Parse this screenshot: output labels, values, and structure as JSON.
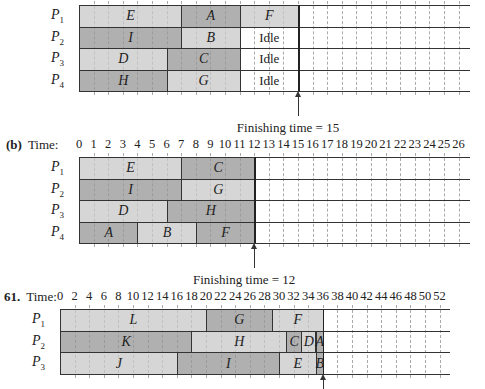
{
  "diagrams": [
    {
      "id": "a",
      "label_prefix": "",
      "time_label": "",
      "show_axis": false,
      "origin_x": 79,
      "px_per_unit": 14.6,
      "top": 5,
      "row_height": 21.5,
      "grid_end_x": 470,
      "units": 26,
      "grid_step": 1,
      "tick_labels": [],
      "processors": [
        "P1",
        "P2",
        "P3",
        "P4"
      ],
      "rows": [
        [
          {
            "task": "E",
            "start": 0,
            "end": 7,
            "shade": "light"
          },
          {
            "task": "A",
            "start": 7,
            "end": 11,
            "shade": "dark"
          },
          {
            "task": "F",
            "start": 11,
            "end": 15,
            "shade": "light"
          }
        ],
        [
          {
            "task": "I",
            "start": 0,
            "end": 7,
            "shade": "dark"
          },
          {
            "task": "B",
            "start": 7,
            "end": 11,
            "shade": "light"
          },
          {
            "task": "Idle",
            "start": 11,
            "end": 15,
            "shade": "idle"
          }
        ],
        [
          {
            "task": "D",
            "start": 0,
            "end": 6,
            "shade": "light"
          },
          {
            "task": "C",
            "start": 6,
            "end": 11,
            "shade": "dark"
          },
          {
            "task": "Idle",
            "start": 11,
            "end": 15,
            "shade": "idle"
          }
        ],
        [
          {
            "task": "H",
            "start": 0,
            "end": 6,
            "shade": "dark"
          },
          {
            "task": "G",
            "start": 6,
            "end": 11,
            "shade": "light"
          },
          {
            "task": "Idle",
            "start": 11,
            "end": 15,
            "shade": "idle"
          }
        ]
      ],
      "finishing_time": 15,
      "finishing_text": "Finishing time = 15"
    },
    {
      "id": "b",
      "label_prefix": "(b)",
      "time_label": "Time:",
      "show_axis": true,
      "origin_x": 79,
      "px_per_unit": 14.6,
      "top": 157,
      "row_height": 21.5,
      "grid_end_x": 470,
      "units": 26,
      "grid_step": 1,
      "tick_labels": [
        "0",
        "1",
        "2",
        "3",
        "4",
        "5",
        "6",
        "7",
        "8",
        "9",
        "10",
        "11",
        "12",
        "13",
        "14",
        "15",
        "16",
        "17",
        "18",
        "19",
        "20",
        "21",
        "22",
        "23",
        "24",
        "25",
        "26"
      ],
      "processors": [
        "P1",
        "P2",
        "P3",
        "P4"
      ],
      "rows": [
        [
          {
            "task": "E",
            "start": 0,
            "end": 7,
            "shade": "light"
          },
          {
            "task": "C",
            "start": 7,
            "end": 12,
            "shade": "dark"
          }
        ],
        [
          {
            "task": "I",
            "start": 0,
            "end": 7,
            "shade": "dark"
          },
          {
            "task": "G",
            "start": 7,
            "end": 12,
            "shade": "light"
          }
        ],
        [
          {
            "task": "D",
            "start": 0,
            "end": 6,
            "shade": "light"
          },
          {
            "task": "H",
            "start": 6,
            "end": 12,
            "shade": "dark"
          }
        ],
        [
          {
            "task": "A",
            "start": 0,
            "end": 4,
            "shade": "dark"
          },
          {
            "task": "B",
            "start": 4,
            "end": 8,
            "shade": "light"
          },
          {
            "task": "F",
            "start": 8,
            "end": 12,
            "shade": "dark"
          }
        ]
      ],
      "finishing_time": 12,
      "finishing_text": "Finishing time = 12"
    },
    {
      "id": "61",
      "label_prefix": "61.",
      "time_label": "Time:",
      "show_axis": true,
      "origin_x": 60,
      "px_per_unit": 7.3,
      "top": 309,
      "row_height": 21.7,
      "grid_end_x": 450,
      "units": 52,
      "grid_step": 2,
      "tick_labels": [
        "0",
        "2",
        "4",
        "6",
        "8",
        "10",
        "12",
        "14",
        "16",
        "18",
        "20",
        "22",
        "24",
        "26",
        "28",
        "30",
        "32",
        "34",
        "36",
        "38",
        "40",
        "42",
        "44",
        "46",
        "48",
        "50",
        "52"
      ],
      "processors": [
        "P1",
        "P2",
        "P3"
      ],
      "rows": [
        [
          {
            "task": "L",
            "start": 0,
            "end": 20,
            "shade": "light"
          },
          {
            "task": "G",
            "start": 20,
            "end": 29,
            "shade": "dark"
          },
          {
            "task": "F",
            "start": 29,
            "end": 36,
            "shade": "light"
          }
        ],
        [
          {
            "task": "K",
            "start": 0,
            "end": 18,
            "shade": "dark"
          },
          {
            "task": "H",
            "start": 18,
            "end": 31,
            "shade": "light"
          },
          {
            "task": "C",
            "start": 31,
            "end": 33,
            "shade": "dark"
          },
          {
            "task": "D",
            "start": 33,
            "end": 35,
            "shade": "light"
          },
          {
            "task": "A",
            "start": 35,
            "end": 36,
            "shade": "dark"
          }
        ],
        [
          {
            "task": "J",
            "start": 0,
            "end": 16,
            "shade": "light"
          },
          {
            "task": "I",
            "start": 16,
            "end": 30,
            "shade": "dark"
          },
          {
            "task": "E",
            "start": 30,
            "end": 35,
            "shade": "light"
          },
          {
            "task": "B",
            "start": 35,
            "end": 36,
            "shade": "dark"
          }
        ]
      ],
      "finishing_time": 36,
      "finishing_text": ""
    }
  ]
}
